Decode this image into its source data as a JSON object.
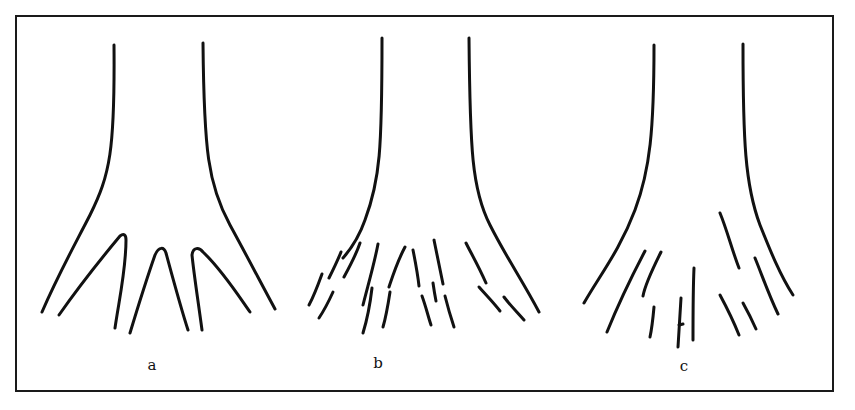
{
  "figure": {
    "frame": {
      "x": 16,
      "y": 16,
      "width": 817,
      "height": 375,
      "stroke": "#1a1a1a"
    },
    "stroke_color": "#111111",
    "panels": [
      {
        "id": "a",
        "label": "a",
        "label_pos": [
          152,
          370
        ],
        "description": "Intact trunk splitting into continuous branches",
        "paths": [
          "M114,45 C115,150 110,175 90,215 C72,250 58,275 42,312",
          "M203,43 C204,150 208,185 230,225 C248,258 262,285 275,309",
          "M59,315 C80,285 100,260 120,236 C124,233 126,235 126,240 C126,270 119,300 115,328",
          "M130,333 C140,300 148,275 155,255 C159,246 164,247 166,253 C172,275 180,305 188,330",
          "M202,330 C198,300 194,275 192,255 C193,247 199,247 203,252 C222,270 238,295 250,312"
        ]
      },
      {
        "id": "b",
        "label": "b",
        "label_pos": [
          378,
          368
        ],
        "description": "Trunk with fragmented, broken branch segments",
        "paths": [
          "M382,38 C382,150 380,180 365,220 C358,240 350,250 343,258",
          "M469,38 C470,150 472,190 490,225 C505,255 522,280 539,312",
          "M341,252 C337,262 333,270 329,278",
          "M360,243 C356,255 350,266 344,277",
          "M322,274 C318,285 314,296 309,305",
          "M333,292 C328,303 323,312 319,318",
          "M378,244 C374,265 368,285 363,305",
          "M372,288 C370,305 367,320 363,333",
          "M405,247 C397,262 392,278 389,287",
          "M390,292 C388,305 386,317 383,327",
          "M413,250 C416,265 418,277 419,286",
          "M434,240 C437,255 440,270 443,284",
          "M433,283 C434,290 435,296 436,301",
          "M422,296 C426,307 428,316 431,325",
          "M445,296 C448,308 451,318 454,327",
          "M466,243 C472,255 478,265 486,283",
          "M479,287 C486,295 493,302 500,311",
          "M504,297 C510,305 517,312 524,320"
        ]
      },
      {
        "id": "c",
        "label": "c",
        "label_pos": [
          684,
          371
        ],
        "description": "Trunk with sparse, isolated branch fragments",
        "paths": [
          "M654,45 C654,130 650,170 635,210 C620,250 600,275 584,303",
          "M743,44 C743,140 745,185 760,225 C770,250 780,275 793,295",
          "M645,251 C635,270 622,295 607,332",
          "M661,252 C652,270 645,285 643,296",
          "M654,307 C653,318 652,328 650,337",
          "M681,298 C680,315 679,330 678,347",
          "M679,325 L683,324",
          "M694,268 C693,290 693,315 693,340",
          "M720,213 C727,230 732,250 739,268",
          "M755,258 C762,275 768,293 778,314",
          "M720,295 C727,308 733,320 739,335",
          "M743,303 C748,312 752,320 756,329"
        ]
      }
    ]
  }
}
